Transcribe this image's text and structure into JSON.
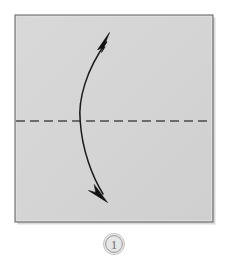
{
  "figure": {
    "kind": "origami-instruction-diagram",
    "background_color": "#ffffff"
  },
  "paper": {
    "name": "square-sheet",
    "fill_color": "#d5d5d5",
    "border_color": "#6b6b6b",
    "shadow_color": "#9a9a9a",
    "x": 15,
    "y": 15,
    "width": 198,
    "height": 207
  },
  "fold_line": {
    "name": "valley-fold-line",
    "style": "dashed",
    "orientation": "horizontal",
    "color": "#4a4a4a",
    "y": 121,
    "x_start": 16,
    "x_end": 212,
    "dash_length": 9,
    "gap_length": 5,
    "stroke_width": 1.6
  },
  "arrow": {
    "name": "double-headed-fold-arrow",
    "meaning": "fold-and-unfold",
    "color": "#1a1a1a",
    "stroke_width": 1.5,
    "head_count": 2,
    "curve_bulge_direction": "left",
    "path": "M 107 41 C 86 70, 78 100, 80 121 C 82 150, 92 176, 103 194",
    "head_top_tip": {
      "x": 109,
      "y": 33
    },
    "head_bottom_tip": {
      "x": 107,
      "y": 202
    }
  },
  "step_badge": {
    "name": "step-number-badge",
    "label": "1",
    "center_x": 114,
    "center_y": 244,
    "radius": 10,
    "fill_color": "#e8e8e8",
    "border_color": "#9c9c9c",
    "text_color": "#6e6e6e"
  }
}
